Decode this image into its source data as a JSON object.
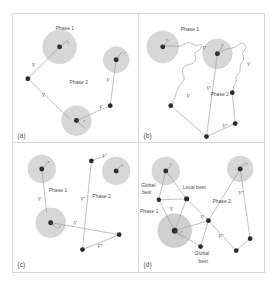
{
  "figure": {
    "panel_count": 4,
    "colors": {
      "background": "#ffffff",
      "panel_border": "#d9d9d9",
      "halo_fill": "#d7d7d7",
      "node": "#2b2b2b",
      "edge": "#9a9a9a",
      "label_text": "#4f4f4f"
    },
    "glyphs": {
      "velocity": "V",
      "velocity_prime": "V'",
      "velocity_double_prime": "V''",
      "radius": "r"
    }
  },
  "panels": [
    {
      "tag": "(a)",
      "name": "panel-a",
      "labels": [
        {
          "text": "Phase 1",
          "x": 43,
          "y": 16
        },
        {
          "text": "Phase 2",
          "x": 57,
          "y": 70
        }
      ],
      "velocity_labels": [
        {
          "text": "V",
          "x": 19,
          "y": 53
        },
        {
          "text": "V",
          "x": 29,
          "y": 83
        },
        {
          "text": "V",
          "x": 94,
          "y": 68
        },
        {
          "text": "V",
          "x": 87,
          "y": 95
        }
      ],
      "radius_labels": [
        {
          "text": "r",
          "x": 55,
          "y": 30
        },
        {
          "text": "r",
          "x": 112,
          "y": 40
        },
        {
          "text": "r",
          "x": 71,
          "y": 108
        }
      ]
    },
    {
      "tag": "(b)",
      "name": "panel-b",
      "labels": [
        {
          "text": "Phase 1",
          "x": 42,
          "y": 17
        },
        {
          "text": "Phase 2",
          "x": 76,
          "y": 82
        }
      ],
      "velocity_labels": [
        {
          "text": "V",
          "x": 64,
          "y": 36
        },
        {
          "text": "V",
          "x": 109,
          "y": 52
        },
        {
          "text": "V",
          "x": 48,
          "y": 84
        },
        {
          "text": "V'",
          "x": 68,
          "y": 76
        },
        {
          "text": "V''",
          "x": 84,
          "y": 112
        }
      ],
      "radius_labels": [
        {
          "text": "r",
          "x": 27,
          "y": 27
        },
        {
          "text": "r",
          "x": 83,
          "y": 32
        }
      ]
    },
    {
      "tag": "(c)",
      "name": "panel-c",
      "labels": [
        {
          "text": "Phase 1",
          "x": 40,
          "y": 49
        },
        {
          "text": "Phase 2",
          "x": 84,
          "y": 55
        }
      ],
      "velocity_labels": [
        {
          "text": "V",
          "x": 25,
          "y": 58
        },
        {
          "text": "V'",
          "x": 70,
          "y": 58
        },
        {
          "text": "V",
          "x": 63,
          "y": 82
        },
        {
          "text": "V'",
          "x": 92,
          "y": 15
        },
        {
          "text": "V''",
          "x": 85,
          "y": 103
        }
      ],
      "radius_labels": [
        {
          "text": "r",
          "x": 35,
          "y": 20
        },
        {
          "text": "r",
          "x": 110,
          "y": 24
        },
        {
          "text": "r",
          "x": 46,
          "y": 85
        }
      ]
    },
    {
      "tag": "(d)",
      "name": "panel-d",
      "labels": [
        {
          "text": "Global",
          "x": 5,
          "y": 44
        },
        {
          "text": "best",
          "x": 7,
          "y": 51
        },
        {
          "text": "Local best",
          "x": 46,
          "y": 46
        },
        {
          "text": "Phase 1",
          "x": 4,
          "y": 69
        },
        {
          "text": "Phase 2",
          "x": 78,
          "y": 60
        },
        {
          "text": "Global",
          "x": 60,
          "y": 110
        },
        {
          "text": "best",
          "x": 62,
          "y": 117
        }
      ],
      "velocity_labels": [
        {
          "text": "V",
          "x": 31,
          "y": 68
        },
        {
          "text": "V",
          "x": 66,
          "y": 76
        },
        {
          "text": "V''",
          "x": 104,
          "y": 52
        },
        {
          "text": "V''",
          "x": 82,
          "y": 93
        }
      ],
      "radius_labels": [
        {
          "text": "r",
          "x": 31,
          "y": 22
        },
        {
          "text": "r",
          "x": 108,
          "y": 22
        },
        {
          "text": "r",
          "x": 42,
          "y": 90
        }
      ]
    }
  ]
}
